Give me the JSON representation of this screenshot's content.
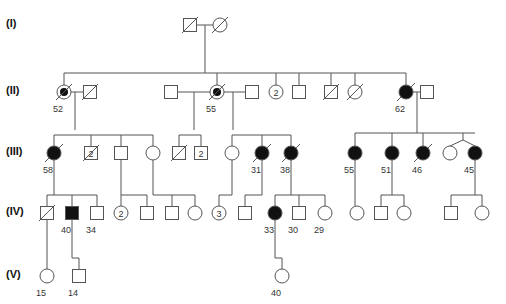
{
  "colors": {
    "line": "#555555",
    "affected": "#111111",
    "label": "#333333",
    "background": "#ffffff"
  },
  "generations": [
    {
      "label": "(I)",
      "y": 25
    },
    {
      "label": "(II)",
      "y": 92
    },
    {
      "label": "(III)",
      "y": 153
    },
    {
      "label": "(IV)",
      "y": 213
    },
    {
      "label": "(V)",
      "y": 276
    }
  ],
  "individuals": [
    {
      "id": "I-1",
      "gen": 1,
      "sex": "male",
      "x": 190,
      "y": 25,
      "status": "deceased"
    },
    {
      "id": "I-2",
      "gen": 1,
      "sex": "female",
      "x": 220,
      "y": 25,
      "status": "deceased"
    },
    {
      "id": "II-1",
      "gen": 2,
      "sex": "female",
      "x": 64,
      "y": 92,
      "status": "carrier-deceased",
      "age": "52"
    },
    {
      "id": "II-2",
      "gen": 2,
      "sex": "male",
      "x": 90,
      "y": 92,
      "status": "deceased"
    },
    {
      "id": "II-3",
      "gen": 2,
      "sex": "male",
      "x": 171,
      "y": 92,
      "status": "unaffected"
    },
    {
      "id": "II-4",
      "gen": 2,
      "sex": "female",
      "x": 217,
      "y": 92,
      "status": "carrier-deceased",
      "age": "55"
    },
    {
      "id": "II-5",
      "gen": 2,
      "sex": "male",
      "x": 252,
      "y": 92,
      "status": "unaffected"
    },
    {
      "id": "II-6",
      "gen": 2,
      "sex": "female",
      "x": 276,
      "y": 92,
      "status": "unaffected",
      "count": "2"
    },
    {
      "id": "II-7",
      "gen": 2,
      "sex": "male",
      "x": 299,
      "y": 92,
      "status": "unaffected"
    },
    {
      "id": "II-8",
      "gen": 2,
      "sex": "male",
      "x": 331,
      "y": 92,
      "status": "deceased"
    },
    {
      "id": "II-9",
      "gen": 2,
      "sex": "female",
      "x": 355,
      "y": 92,
      "status": "deceased"
    },
    {
      "id": "II-10",
      "gen": 2,
      "sex": "female",
      "x": 406,
      "y": 92,
      "status": "affected-deceased",
      "age": "62"
    },
    {
      "id": "II-11",
      "gen": 2,
      "sex": "male",
      "x": 427,
      "y": 92,
      "status": "unaffected"
    },
    {
      "id": "III-1",
      "gen": 3,
      "sex": "female",
      "x": 54,
      "y": 153,
      "status": "affected-deceased",
      "age": "58"
    },
    {
      "id": "III-2",
      "gen": 3,
      "sex": "male",
      "x": 91,
      "y": 153,
      "status": "deceased",
      "count": "2"
    },
    {
      "id": "III-3",
      "gen": 3,
      "sex": "male",
      "x": 121,
      "y": 153,
      "status": "unaffected"
    },
    {
      "id": "III-4",
      "gen": 3,
      "sex": "female",
      "x": 153,
      "y": 153,
      "status": "unaffected"
    },
    {
      "id": "III-5",
      "gen": 3,
      "sex": "male",
      "x": 179,
      "y": 153,
      "status": "deceased"
    },
    {
      "id": "III-6",
      "gen": 3,
      "sex": "male",
      "x": 201,
      "y": 153,
      "status": "unaffected",
      "count": "2"
    },
    {
      "id": "III-7",
      "gen": 3,
      "sex": "female",
      "x": 232,
      "y": 153,
      "status": "unaffected"
    },
    {
      "id": "III-8",
      "gen": 3,
      "sex": "female",
      "x": 262,
      "y": 153,
      "status": "affected-deceased",
      "age": "31"
    },
    {
      "id": "III-9",
      "gen": 3,
      "sex": "female",
      "x": 291,
      "y": 153,
      "status": "affected-deceased",
      "age": "38"
    },
    {
      "id": "III-10",
      "gen": 3,
      "sex": "female",
      "x": 355,
      "y": 153,
      "status": "affected",
      "age": "55"
    },
    {
      "id": "III-11",
      "gen": 3,
      "sex": "female",
      "x": 392,
      "y": 153,
      "status": "affected",
      "age": "51"
    },
    {
      "id": "III-12",
      "gen": 3,
      "sex": "female",
      "x": 423,
      "y": 153,
      "status": "affected-deceased",
      "age": "46"
    },
    {
      "id": "III-13",
      "gen": 3,
      "sex": "female",
      "x": 450,
      "y": 153,
      "status": "unaffected"
    },
    {
      "id": "III-14",
      "gen": 3,
      "sex": "female",
      "x": 475,
      "y": 153,
      "status": "affected",
      "age": "45"
    },
    {
      "id": "IV-1",
      "gen": 4,
      "sex": "male",
      "x": 47,
      "y": 213,
      "status": "deceased"
    },
    {
      "id": "IV-2",
      "gen": 4,
      "sex": "male",
      "x": 72,
      "y": 213,
      "status": "affected",
      "age": "40"
    },
    {
      "id": "IV-3",
      "gen": 4,
      "sex": "male",
      "x": 97,
      "y": 213,
      "status": "unaffected",
      "age": "34"
    },
    {
      "id": "IV-4",
      "gen": 4,
      "sex": "female",
      "x": 121,
      "y": 213,
      "status": "unaffected",
      "count": "2"
    },
    {
      "id": "IV-5",
      "gen": 4,
      "sex": "male",
      "x": 147,
      "y": 213,
      "status": "unaffected"
    },
    {
      "id": "IV-6",
      "gen": 4,
      "sex": "male",
      "x": 172,
      "y": 213,
      "status": "unaffected"
    },
    {
      "id": "IV-7",
      "gen": 4,
      "sex": "female",
      "x": 195,
      "y": 213,
      "status": "unaffected"
    },
    {
      "id": "IV-8",
      "gen": 4,
      "sex": "female",
      "x": 219,
      "y": 213,
      "status": "unaffected",
      "count": "3"
    },
    {
      "id": "IV-9",
      "gen": 4,
      "sex": "male",
      "x": 245,
      "y": 213,
      "status": "unaffected"
    },
    {
      "id": "IV-10",
      "gen": 4,
      "sex": "female",
      "x": 275,
      "y": 213,
      "status": "affected",
      "age": "33"
    },
    {
      "id": "IV-11",
      "gen": 4,
      "sex": "male",
      "x": 299,
      "y": 213,
      "status": "unaffected",
      "age": "30"
    },
    {
      "id": "IV-12",
      "gen": 4,
      "sex": "female",
      "x": 325,
      "y": 213,
      "status": "unaffected",
      "age": "29"
    },
    {
      "id": "IV-13",
      "gen": 4,
      "sex": "female",
      "x": 357,
      "y": 213,
      "status": "unaffected"
    },
    {
      "id": "IV-14",
      "gen": 4,
      "sex": "male",
      "x": 381,
      "y": 213,
      "status": "unaffected"
    },
    {
      "id": "IV-15",
      "gen": 4,
      "sex": "female",
      "x": 404,
      "y": 213,
      "status": "unaffected"
    },
    {
      "id": "IV-16",
      "gen": 4,
      "sex": "male",
      "x": 451,
      "y": 213,
      "status": "unaffected"
    },
    {
      "id": "IV-17",
      "gen": 4,
      "sex": "female",
      "x": 482,
      "y": 213,
      "status": "unaffected"
    },
    {
      "id": "V-1",
      "gen": 5,
      "sex": "female",
      "x": 47,
      "y": 276,
      "status": "unaffected",
      "age": "15"
    },
    {
      "id": "V-2",
      "gen": 5,
      "sex": "male",
      "x": 79,
      "y": 276,
      "status": "unaffected",
      "age": "14"
    },
    {
      "id": "V-3",
      "gen": 5,
      "sex": "female",
      "x": 282,
      "y": 276,
      "status": "unaffected",
      "age": "40"
    }
  ],
  "lines": [
    [
      196,
      25,
      214,
      25
    ],
    [
      205,
      25,
      205,
      73
    ],
    [
      64,
      73,
      406,
      73
    ],
    [
      64,
      73,
      64,
      85
    ],
    [
      205,
      73,
      205,
      73
    ],
    [
      217,
      73,
      217,
      85
    ],
    [
      276,
      73,
      276,
      85
    ],
    [
      299,
      73,
      299,
      86
    ],
    [
      331,
      73,
      331,
      86
    ],
    [
      355,
      73,
      355,
      85
    ],
    [
      406,
      73,
      406,
      85
    ],
    [
      71,
      92,
      84,
      92
    ],
    [
      75,
      92,
      75,
      130
    ],
    [
      177,
      92,
      210,
      92
    ],
    [
      194,
      92,
      194,
      130
    ],
    [
      224,
      92,
      246,
      92
    ],
    [
      233,
      92,
      233,
      130
    ],
    [
      413,
      92,
      421,
      92
    ],
    [
      417,
      92,
      417,
      133
    ],
    [
      54,
      135,
      153,
      135
    ],
    [
      54,
      135,
      54,
      146
    ],
    [
      91,
      135,
      91,
      147
    ],
    [
      121,
      135,
      121,
      147
    ],
    [
      153,
      135,
      153,
      146
    ],
    [
      179,
      135,
      201,
      135
    ],
    [
      179,
      135,
      179,
      147
    ],
    [
      201,
      135,
      201,
      147
    ],
    [
      232,
      135,
      291,
      135
    ],
    [
      232,
      135,
      232,
      146
    ],
    [
      262,
      135,
      262,
      146
    ],
    [
      291,
      135,
      291,
      146
    ],
    [
      355,
      133,
      475,
      133
    ],
    [
      355,
      133,
      355,
      146
    ],
    [
      392,
      133,
      392,
      146
    ],
    [
      423,
      133,
      423,
      146
    ],
    [
      463,
      133,
      463,
      140
    ],
    [
      463,
      140,
      450,
      146
    ],
    [
      463,
      140,
      475,
      146
    ],
    [
      54,
      160,
      54,
      195
    ],
    [
      47,
      195,
      97,
      195
    ],
    [
      47,
      195,
      47,
      207
    ],
    [
      72,
      195,
      72,
      207
    ],
    [
      97,
      195,
      97,
      207
    ],
    [
      121,
      160,
      121,
      195
    ],
    [
      121,
      195,
      147,
      195
    ],
    [
      121,
      195,
      121,
      206
    ],
    [
      147,
      195,
      147,
      207
    ],
    [
      153,
      160,
      153,
      195
    ],
    [
      153,
      195,
      195,
      195
    ],
    [
      172,
      195,
      172,
      207
    ],
    [
      195,
      195,
      195,
      206
    ],
    [
      232,
      160,
      232,
      195
    ],
    [
      219,
      195,
      232,
      195
    ],
    [
      219,
      195,
      219,
      206
    ],
    [
      262,
      160,
      262,
      195
    ],
    [
      245,
      195,
      262,
      195
    ],
    [
      245,
      195,
      245,
      207
    ],
    [
      291,
      160,
      291,
      195
    ],
    [
      275,
      195,
      325,
      195
    ],
    [
      275,
      195,
      275,
      206
    ],
    [
      299,
      195,
      299,
      207
    ],
    [
      325,
      195,
      325,
      206
    ],
    [
      355,
      160,
      355,
      206
    ],
    [
      392,
      160,
      392,
      195
    ],
    [
      381,
      195,
      404,
      195
    ],
    [
      381,
      195,
      381,
      207
    ],
    [
      404,
      195,
      404,
      206
    ],
    [
      475,
      160,
      475,
      195
    ],
    [
      451,
      195,
      482,
      195
    ],
    [
      451,
      195,
      451,
      207
    ],
    [
      482,
      195,
      482,
      206
    ],
    [
      47,
      220,
      47,
      269
    ],
    [
      72,
      220,
      72,
      258
    ],
    [
      72,
      258,
      79,
      258
    ],
    [
      79,
      258,
      79,
      270
    ],
    [
      275,
      220,
      275,
      258
    ],
    [
      275,
      258,
      282,
      258
    ],
    [
      282,
      258,
      282,
      269
    ]
  ]
}
